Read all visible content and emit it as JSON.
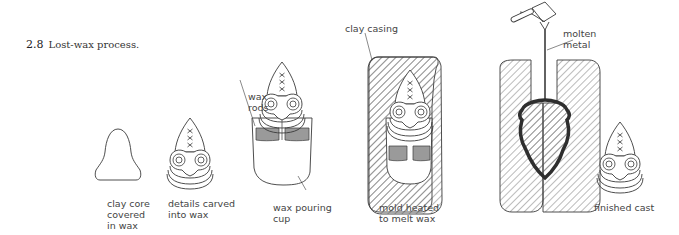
{
  "figure": {
    "number": "2.8",
    "caption": "Lost-wax process."
  },
  "stages": [
    {
      "id": "stage-1",
      "label": "clay core\ncovered\nin wax"
    },
    {
      "id": "stage-2",
      "label": "details carved\ninto wax"
    },
    {
      "id": "stage-3",
      "label": "wax pouring\ncup"
    },
    {
      "id": "stage-4",
      "label": "mold heated\nto melt wax"
    },
    {
      "id": "stage-5",
      "label": "finished cast"
    }
  ],
  "callouts": {
    "wax_rods": "wax\nrods",
    "clay_casing": "clay casing",
    "molten_metal": "molten\nmetal"
  },
  "colors": {
    "line": "#3a3a3a",
    "wax_fill": "#9a9a9a",
    "metal": "#2e2e2e",
    "hatch": "#555555"
  }
}
